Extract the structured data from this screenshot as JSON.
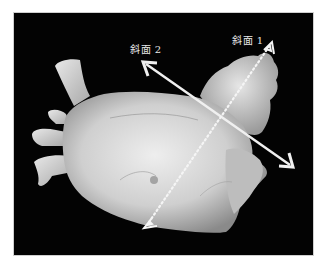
{
  "figure": {
    "background_color": "#030303",
    "object_color": "#d9d9d9",
    "annotations": [
      {
        "id": "plane-2",
        "label": "斜面 2",
        "style": "solid double-headed arrow",
        "color": "#f0f0f0"
      },
      {
        "id": "plane-1",
        "label": "斜面 1",
        "style": "dotted line with hollow arrowheads",
        "color": "#f5f5f5"
      }
    ]
  }
}
